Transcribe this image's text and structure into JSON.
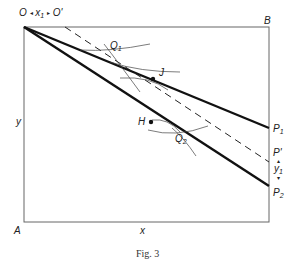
{
  "figure": {
    "caption": "Fig. 3",
    "top_label": {
      "left": "O",
      "arrow_left": "◂",
      "var": "x",
      "sub": "1",
      "arrow_right": "▸",
      "right": "O'"
    },
    "corner_labels": {
      "B": "B",
      "A": "A"
    },
    "axis_labels": {
      "y": "y",
      "x": "x"
    },
    "right_labels": {
      "P1": {
        "main": "P",
        "sub": "1"
      },
      "Pprime": "P'",
      "y1": {
        "main": "y",
        "sub": "1",
        "up": "▴",
        "down": "▾"
      },
      "P2": {
        "main": "P",
        "sub": "2"
      }
    },
    "points": {
      "Q1": {
        "main": "Q",
        "sub": "1"
      },
      "J": "J",
      "H": "H",
      "Q2": {
        "main": "Q",
        "sub": "2"
      }
    },
    "colors": {
      "line": "#111111",
      "frame": "#555555",
      "thin": "#444444"
    }
  }
}
